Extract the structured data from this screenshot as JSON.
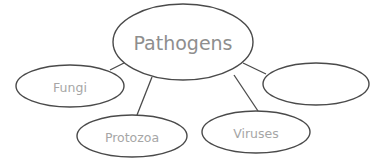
{
  "diagram": {
    "type": "concept-map",
    "center": {
      "label": "Pathogens"
    },
    "nodes": [
      {
        "id": "fungi",
        "label": "Fungi"
      },
      {
        "id": "protozoa",
        "label": "Protozoa"
      },
      {
        "id": "viruses",
        "label": "Viruses"
      },
      {
        "id": "blank",
        "label": ""
      }
    ],
    "colors": {
      "stroke": "#4a4a4a",
      "text": "#9a9a9a",
      "background": "#ffffff"
    }
  }
}
